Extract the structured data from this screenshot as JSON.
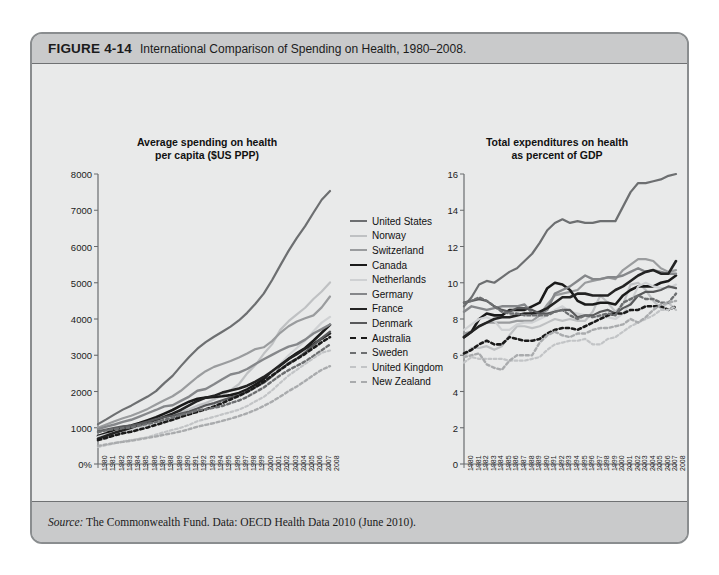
{
  "figure": {
    "number": "FIGURE 4-14",
    "caption": "International Comparison of Spending on Health, 1980–2008.",
    "source_prefix": "Source:",
    "source_text": " The Commonwealth Fund. Data: OECD Health Data 2010 (June 2010)."
  },
  "legend": {
    "items": [
      {
        "label": "United States",
        "color": "#6d6f71",
        "dashed": false,
        "width": 2.2
      },
      {
        "label": "Norway",
        "color": "#bfc1c3",
        "dashed": false,
        "width": 2.2
      },
      {
        "label": "Switzerland",
        "color": "#9a9c9e",
        "dashed": false,
        "width": 2.2
      },
      {
        "label": "Canada",
        "color": "#1a1a1a",
        "dashed": false,
        "width": 2.6
      },
      {
        "label": "Netherlands",
        "color": "#cfd1d3",
        "dashed": false,
        "width": 2.2
      },
      {
        "label": "Germany",
        "color": "#85878a",
        "dashed": false,
        "width": 2.4
      },
      {
        "label": "France",
        "color": "#232323",
        "dashed": false,
        "width": 2.6
      },
      {
        "label": "Denmark",
        "color": "#58595b",
        "dashed": false,
        "width": 2.2
      },
      {
        "label": "Australia",
        "color": "#1a1a1a",
        "dashed": true,
        "width": 2.6
      },
      {
        "label": "Sweden",
        "color": "#6d6f71",
        "dashed": true,
        "width": 2.4
      },
      {
        "label": "United Kingdom",
        "color": "#c2c4c6",
        "dashed": true,
        "width": 2.2
      },
      {
        "label": "New Zealand",
        "color": "#a9abad",
        "dashed": true,
        "width": 2.4
      }
    ]
  },
  "chart_data": [
    {
      "type": "line",
      "panel": "left",
      "title": "Average spending on health\nper capita ($US PPP)",
      "title_line1": "Average spending on health",
      "title_line2": "per capita ($US PPP)",
      "xlabel": "",
      "ylabel": "",
      "ylim": [
        0,
        8000
      ],
      "yticks": [
        0,
        1000,
        2000,
        3000,
        4000,
        5000,
        6000,
        7000,
        8000
      ],
      "yticklabels": [
        "0%",
        "1000",
        "2000",
        "3000",
        "4000",
        "5000",
        "6000",
        "7000",
        "8000"
      ],
      "grid": false,
      "legend_position": "right-outside",
      "x": [
        1980,
        1981,
        1982,
        1983,
        1984,
        1985,
        1986,
        1987,
        1988,
        1989,
        1990,
        1991,
        1992,
        1993,
        1994,
        1995,
        1996,
        1997,
        1998,
        1999,
        2000,
        2001,
        2002,
        2003,
        2004,
        2005,
        2006,
        2007,
        2008
      ],
      "series": [
        {
          "name": "United States",
          "values": [
            1100,
            1230,
            1370,
            1500,
            1610,
            1740,
            1860,
            2010,
            2230,
            2430,
            2700,
            2950,
            3180,
            3360,
            3510,
            3650,
            3790,
            3960,
            4170,
            4420,
            4700,
            5070,
            5480,
            5880,
            6240,
            6560,
            6930,
            7290,
            7530
          ]
        },
        {
          "name": "Norway",
          "values": [
            670,
            740,
            800,
            860,
            910,
            990,
            1120,
            1230,
            1330,
            1380,
            1430,
            1510,
            1610,
            1680,
            1780,
            1900,
            2040,
            2200,
            2500,
            2730,
            3040,
            3300,
            3700,
            3940,
            4130,
            4310,
            4550,
            4760,
            5010
          ]
        },
        {
          "name": "Switzerland",
          "values": [
            1000,
            1090,
            1180,
            1260,
            1330,
            1420,
            1520,
            1640,
            1760,
            1870,
            2020,
            2210,
            2400,
            2560,
            2680,
            2760,
            2840,
            2940,
            3050,
            3170,
            3220,
            3390,
            3620,
            3800,
            3930,
            4020,
            4100,
            4320,
            4620
          ]
        },
        {
          "name": "Canada",
          "values": [
            770,
            850,
            950,
            1010,
            1060,
            1130,
            1210,
            1290,
            1390,
            1490,
            1610,
            1720,
            1800,
            1830,
            1850,
            1870,
            1900,
            1960,
            2060,
            2190,
            2340,
            2530,
            2720,
            2900,
            3060,
            3200,
            3400,
            3620,
            3840
          ]
        },
        {
          "name": "Netherlands",
          "values": [
            750,
            810,
            870,
            910,
            930,
            980,
            1040,
            1120,
            1180,
            1250,
            1330,
            1430,
            1550,
            1610,
            1660,
            1720,
            1780,
            1860,
            1970,
            2110,
            2250,
            2480,
            2760,
            3000,
            3200,
            3400,
            3660,
            3900,
            4060
          ]
        },
        {
          "name": "Germany",
          "values": [
            960,
            1030,
            1090,
            1160,
            1220,
            1310,
            1400,
            1490,
            1590,
            1620,
            1740,
            1860,
            2020,
            2070,
            2200,
            2340,
            2470,
            2520,
            2620,
            2760,
            2890,
            3010,
            3130,
            3240,
            3300,
            3430,
            3600,
            3720,
            3850
          ]
        },
        {
          "name": "France",
          "values": [
            700,
            780,
            860,
            930,
            1000,
            1080,
            1150,
            1210,
            1300,
            1390,
            1490,
            1620,
            1740,
            1830,
            1880,
            1970,
            2030,
            2080,
            2160,
            2270,
            2400,
            2560,
            2730,
            2900,
            3030,
            3180,
            3310,
            3460,
            3600
          ]
        },
        {
          "name": "Denmark",
          "values": [
            900,
            950,
            1000,
            1040,
            1060,
            1110,
            1170,
            1240,
            1290,
            1330,
            1390,
            1450,
            1530,
            1620,
            1680,
            1760,
            1830,
            1900,
            2000,
            2120,
            2240,
            2420,
            2610,
            2780,
            2910,
            3080,
            3280,
            3470,
            3650
          ]
        },
        {
          "name": "Australia",
          "values": [
            660,
            720,
            790,
            850,
            890,
            950,
            1010,
            1080,
            1150,
            1220,
            1300,
            1370,
            1440,
            1510,
            1590,
            1680,
            1780,
            1880,
            1990,
            2120,
            2270,
            2440,
            2600,
            2760,
            2900,
            3040,
            3200,
            3360,
            3500
          ]
        },
        {
          "name": "Sweden",
          "values": [
            880,
            930,
            960,
            990,
            1010,
            1060,
            1110,
            1160,
            1220,
            1280,
            1360,
            1410,
            1480,
            1510,
            1550,
            1600,
            1680,
            1750,
            1850,
            1980,
            2110,
            2280,
            2450,
            2590,
            2710,
            2830,
            2980,
            3140,
            3300
          ]
        },
        {
          "name": "United Kingdom",
          "values": [
            470,
            520,
            570,
            620,
            660,
            700,
            740,
            810,
            880,
            940,
            1000,
            1080,
            1180,
            1240,
            1300,
            1370,
            1430,
            1500,
            1600,
            1730,
            1850,
            2030,
            2240,
            2440,
            2600,
            2760,
            2920,
            3070,
            3130
          ]
        },
        {
          "name": "New Zealand",
          "values": [
            500,
            540,
            580,
            610,
            640,
            680,
            720,
            760,
            810,
            850,
            900,
            960,
            1030,
            1080,
            1130,
            1190,
            1250,
            1320,
            1400,
            1490,
            1600,
            1720,
            1860,
            2010,
            2140,
            2290,
            2450,
            2600,
            2700
          ]
        }
      ]
    },
    {
      "type": "line",
      "panel": "right",
      "title": "Total expenditures on health\nas percent of GDP",
      "title_line1": "Total expenditures on health",
      "title_line2": "as percent of GDP",
      "xlabel": "",
      "ylabel": "",
      "ylim": [
        0,
        16
      ],
      "yticks": [
        0,
        2,
        4,
        6,
        8,
        10,
        12,
        14,
        16
      ],
      "yticklabels": [
        "0",
        "2",
        "4",
        "6",
        "8",
        "10",
        "12",
        "14",
        "16"
      ],
      "grid": false,
      "legend_position": "shared-left",
      "x": [
        1980,
        1981,
        1982,
        1983,
        1984,
        1985,
        1986,
        1987,
        1988,
        1989,
        1990,
        1991,
        1992,
        1993,
        1994,
        1995,
        1996,
        1997,
        1998,
        1999,
        2000,
        2001,
        2002,
        2003,
        2004,
        2005,
        2006,
        2007,
        2008
      ],
      "series": [
        {
          "name": "United States",
          "values": [
            8.7,
            9.2,
            9.9,
            10.1,
            10.0,
            10.3,
            10.6,
            10.8,
            11.2,
            11.6,
            12.2,
            12.9,
            13.3,
            13.5,
            13.3,
            13.4,
            13.3,
            13.3,
            13.4,
            13.4,
            13.4,
            14.2,
            15.0,
            15.5,
            15.5,
            15.6,
            15.7,
            15.9,
            16.0
          ]
        },
        {
          "name": "Norway",
          "values": [
            5.9,
            6.4,
            6.4,
            6.5,
            6.3,
            6.5,
            7.1,
            7.6,
            7.6,
            7.5,
            7.6,
            7.8,
            8.0,
            7.9,
            8.0,
            7.9,
            7.9,
            8.4,
            9.3,
            8.9,
            8.4,
            8.8,
            9.9,
            10.0,
            9.6,
            9.0,
            8.6,
            8.9,
            8.5
          ]
        },
        {
          "name": "Switzerland",
          "values": [
            7.2,
            7.3,
            7.6,
            7.8,
            7.8,
            7.8,
            7.8,
            7.9,
            7.9,
            7.9,
            8.2,
            8.8,
            9.3,
            9.4,
            9.5,
            9.6,
            10.0,
            10.1,
            10.2,
            10.3,
            10.2,
            10.7,
            11.0,
            11.3,
            11.3,
            11.2,
            10.8,
            10.6,
            10.7
          ]
        },
        {
          "name": "Canada",
          "values": [
            7.0,
            7.3,
            8.0,
            8.3,
            8.2,
            8.2,
            8.5,
            8.5,
            8.5,
            8.7,
            8.9,
            9.7,
            10.0,
            9.9,
            9.6,
            9.0,
            8.8,
            8.8,
            8.9,
            8.9,
            8.8,
            9.3,
            9.6,
            9.8,
            9.8,
            9.8,
            10.0,
            10.1,
            10.4
          ]
        },
        {
          "name": "Netherlands",
          "values": [
            7.4,
            7.7,
            8.0,
            8.1,
            7.9,
            7.4,
            7.4,
            7.7,
            7.8,
            7.8,
            8.0,
            8.2,
            8.5,
            8.7,
            8.4,
            8.3,
            8.2,
            8.1,
            8.1,
            8.1,
            8.0,
            8.3,
            8.9,
            9.8,
            10.0,
            9.8,
            9.7,
            9.7,
            9.9
          ]
        },
        {
          "name": "Germany",
          "values": [
            8.4,
            8.7,
            8.6,
            8.5,
            8.6,
            8.7,
            8.7,
            8.7,
            8.8,
            8.3,
            8.3,
            8.5,
            9.4,
            9.6,
            9.8,
            10.1,
            10.4,
            10.2,
            10.2,
            10.3,
            10.3,
            10.4,
            10.6,
            10.8,
            10.6,
            10.7,
            10.6,
            10.5,
            10.5
          ]
        },
        {
          "name": "France",
          "values": [
            7.0,
            7.3,
            7.6,
            7.8,
            8.0,
            8.1,
            8.1,
            8.2,
            8.3,
            8.3,
            8.4,
            8.6,
            8.9,
            9.2,
            9.2,
            9.4,
            9.4,
            9.3,
            9.3,
            9.3,
            9.6,
            9.8,
            10.1,
            10.4,
            10.6,
            10.7,
            10.5,
            10.5,
            11.2
          ]
        },
        {
          "name": "Denmark",
          "values": [
            8.9,
            9.0,
            9.1,
            9.0,
            8.7,
            8.5,
            8.4,
            8.6,
            8.6,
            8.5,
            8.3,
            8.3,
            8.4,
            8.5,
            8.5,
            8.1,
            8.2,
            8.2,
            8.4,
            8.5,
            8.3,
            8.6,
            8.8,
            9.3,
            9.5,
            9.5,
            9.6,
            9.8,
            9.7
          ]
        },
        {
          "name": "Australia",
          "values": [
            6.1,
            6.3,
            6.6,
            6.8,
            6.6,
            6.6,
            7.0,
            6.9,
            6.8,
            6.8,
            6.9,
            7.2,
            7.4,
            7.5,
            7.5,
            7.4,
            7.6,
            7.8,
            8.0,
            8.2,
            8.3,
            8.3,
            8.5,
            8.5,
            8.7,
            8.7,
            8.7,
            8.5,
            8.7
          ]
        },
        {
          "name": "Sweden",
          "values": [
            8.9,
            9.0,
            9.2,
            9.0,
            8.7,
            8.4,
            8.3,
            8.3,
            8.2,
            8.2,
            8.2,
            8.2,
            8.4,
            8.5,
            8.2,
            8.0,
            8.2,
            8.1,
            8.2,
            8.3,
            8.2,
            8.9,
            9.1,
            9.3,
            9.1,
            9.1,
            8.9,
            8.9,
            9.4
          ]
        },
        {
          "name": "United Kingdom",
          "values": [
            5.6,
            5.9,
            5.8,
            5.8,
            5.8,
            5.8,
            5.7,
            5.7,
            5.7,
            5.8,
            5.9,
            6.3,
            6.6,
            6.7,
            6.8,
            6.8,
            6.9,
            6.6,
            6.6,
            6.9,
            7.0,
            7.3,
            7.6,
            7.8,
            8.0,
            8.2,
            8.5,
            8.5,
            8.7
          ]
        },
        {
          "name": "New Zealand",
          "values": [
            5.9,
            6.0,
            6.1,
            5.5,
            5.3,
            5.2,
            5.7,
            6.0,
            6.0,
            6.0,
            6.7,
            7.1,
            7.3,
            7.1,
            7.0,
            7.2,
            7.2,
            7.4,
            7.5,
            7.5,
            7.6,
            7.7,
            8.0,
            7.8,
            8.1,
            8.5,
            8.8,
            8.9,
            9.0
          ]
        }
      ]
    }
  ]
}
